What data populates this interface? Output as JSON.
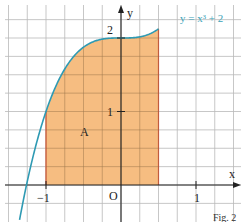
{
  "chart_data": {
    "type": "area",
    "title": "",
    "function": "x^3 + 2",
    "curve_label": "y = x³ + 2",
    "xlabel": "x",
    "ylabel": "y",
    "origin_label": "O",
    "xlim": [
      -1.55,
      1.6
    ],
    "ylim": [
      -0.25,
      2.45
    ],
    "grid": true,
    "grid_step": 0.25,
    "x_ticks": [
      {
        "value": -1,
        "label": "−1"
      },
      {
        "value": 1,
        "label": "1"
      }
    ],
    "y_ticks": [
      {
        "value": 1,
        "label": "1"
      },
      {
        "value": 2,
        "label": "2"
      }
    ],
    "shaded_region": {
      "label": "A",
      "x_from": -1,
      "x_to": 0.5,
      "color": "#f5b26b",
      "boundary_color": "#e0553a"
    },
    "curve_color": "#2e9ab3",
    "caption": "Fig. 2"
  }
}
